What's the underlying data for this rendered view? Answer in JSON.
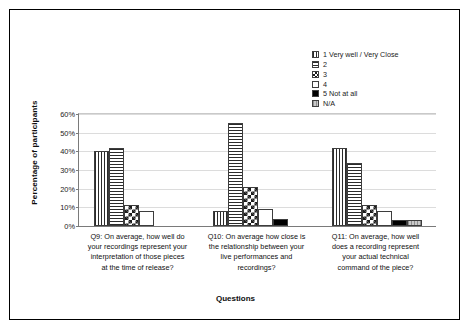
{
  "chart_data": {
    "type": "bar",
    "title": "",
    "xlabel": "Questions",
    "ylabel": "Percentage of participants",
    "ylim": [
      0,
      60
    ],
    "ytick_labels": [
      "0%",
      "10%",
      "20%",
      "30%",
      "40%",
      "50%",
      "60%"
    ],
    "ytick_values": [
      0,
      10,
      20,
      30,
      40,
      50,
      60
    ],
    "grid": true,
    "legend_position": "top-right",
    "categories": [
      "Q9: On average, how well do your recordings represent your interpretation of those pieces at the time of release?",
      "Q10: On average how close is the relationship between your live performances and recordings?",
      "Q11: On average, how well does a recording represent your actual technical command of the piece?"
    ],
    "category_lines": [
      [
        "Q9: On average, how well do",
        "your recordings represent your",
        "interpretation of those pieces",
        "at the time of release?"
      ],
      [
        "Q10: On average how close is",
        "the relationship between your",
        "live performances and",
        "recordings?"
      ],
      [
        "Q11: On average, how well",
        "does a recording represent",
        "your actual technical",
        "command of the piece?"
      ]
    ],
    "series": [
      {
        "name": "1 Very well / Very Close",
        "pattern": "vertical-lines",
        "values": [
          40,
          8,
          42
        ]
      },
      {
        "name": "2",
        "pattern": "horizontal-lines",
        "values": [
          42,
          55,
          34
        ]
      },
      {
        "name": "3",
        "pattern": "checkerboard",
        "values": [
          11,
          21,
          11
        ]
      },
      {
        "name": "4",
        "pattern": "white-empty",
        "values": [
          8,
          9,
          8
        ]
      },
      {
        "name": "5 Not at all",
        "pattern": "solid-black",
        "values": [
          0,
          4,
          3
        ]
      },
      {
        "name": "N/A",
        "pattern": "gray-hatched",
        "values": [
          0,
          0,
          3
        ]
      }
    ]
  },
  "colors": {
    "frame": "#000000",
    "axis": "#7a7a7a",
    "grid": "#dcdcdc",
    "bar_outline": "#3d3d3d",
    "solid_black": "#000000",
    "na_gray": "#b3b3b3"
  }
}
